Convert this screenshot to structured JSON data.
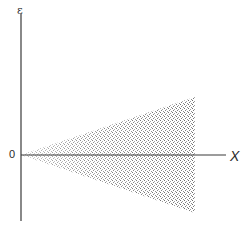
{
  "diagram": {
    "axes": {
      "x_label": "X",
      "y_label": "ε",
      "origin_label": "0"
    },
    "region": {
      "shape": "wedge",
      "fill": "stippled",
      "apex": "origin",
      "extends_to": "right"
    },
    "colors": {
      "axis": "#3a3a3a",
      "stipple": "#555555",
      "background": "#ffffff"
    }
  }
}
